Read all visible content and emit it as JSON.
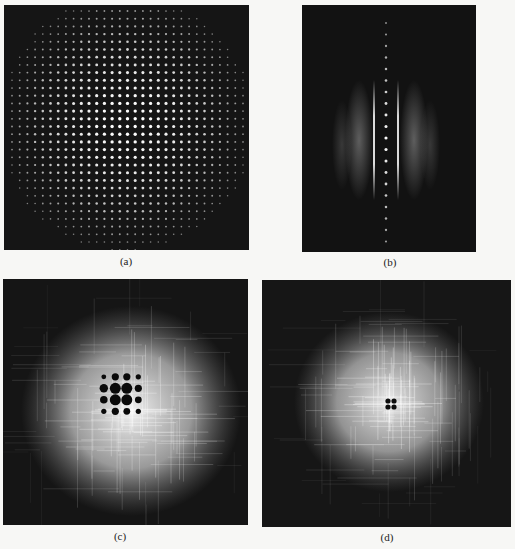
{
  "figure": {
    "panels": [
      {
        "id": "a",
        "label": "(a)",
        "description": "Square lattice of bright diffraction spots on dark background, intensity falling off radially",
        "lattice_spacing_px": 7.7
      },
      {
        "id": "b",
        "label": "(b)",
        "description": "Vertical row of bright spots with two bright vertical streaks and diffuse side fringes",
        "spot_spacing_px": 11.5
      },
      {
        "id": "c",
        "label": "(c)",
        "description": "Bright diffuse halo with crosshatched streaks and central 4x4 array of dark spots"
      },
      {
        "id": "d",
        "label": "(d)",
        "description": "Bright crosshatched diffuse halo with small dark cross-shaped 2x2 spots at center"
      }
    ]
  },
  "colors": {
    "background": "#f7f7f5",
    "panel_dark": "#141414",
    "spot": "#f2f2f2"
  }
}
